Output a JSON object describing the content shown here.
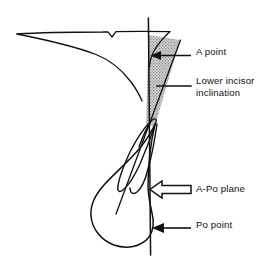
{
  "figure": {
    "type": "cephalometric-tracing-diagram",
    "background_color": "#ffffff",
    "line_color": "#111111",
    "shaded_region_color": "#b3b3b3",
    "text_color": "#111111",
    "canvas": {
      "width": 266,
      "height": 270
    }
  },
  "annotations": [
    {
      "id": "a-point",
      "label": "A point",
      "leader": "solid-arrow-left",
      "target_description": "deepest point of anterior maxilla on the A-Po line",
      "target_xy": [
        152,
        57
      ],
      "label_xy": [
        196,
        46
      ]
    },
    {
      "id": "lower-incisor-inclination",
      "label": "Lower incisor\ninclination",
      "leader": "plain-line",
      "target_description": "shaded wedge between A-Po plane and lower incisor axis",
      "target_xy": [
        158,
        85
      ],
      "label_xy": [
        196,
        75
      ]
    },
    {
      "id": "a-po-plane",
      "label": "A-Po plane",
      "leader": "hollow-outline-arrow-left",
      "target_description": "vertical reference line from A point to Pogonion",
      "target_xy": [
        150,
        190
      ],
      "label_xy": [
        196,
        183
      ]
    },
    {
      "id": "po-point",
      "label": "Po point",
      "leader": "solid-arrow-left",
      "target_description": "Pogonion, most anterior point of the bony chin",
      "target_xy": [
        150,
        228
      ],
      "label_xy": [
        196,
        219
      ]
    }
  ],
  "structures": [
    {
      "id": "maxilla-profile",
      "label": "Maxilla / palatal profile outline"
    },
    {
      "id": "apo-reference-line",
      "label": "A-Po reference line (vertical)"
    },
    {
      "id": "shaded-wedge",
      "label": "Lower incisor inclination wedge (shaded)"
    },
    {
      "id": "lower-incisor-tooth",
      "label": "Lower incisor tooth outline"
    },
    {
      "id": "mandible-symphysis",
      "label": "Mandibular symphysis / chin outline"
    },
    {
      "id": "incisor-long-axis",
      "label": "Lower incisor long axis line"
    }
  ]
}
